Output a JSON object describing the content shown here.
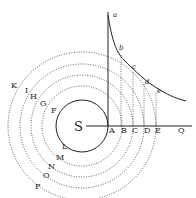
{
  "diagram": {
    "center_label": "S",
    "axis_labels": [
      "A",
      "B",
      "C",
      "D",
      "E",
      "Q"
    ],
    "upper_left_labels": [
      "K",
      "I",
      "H",
      "G",
      "F"
    ],
    "lower_labels": [
      "L",
      "M",
      "N",
      "O",
      "P"
    ],
    "curve_labels": [
      "a",
      "b",
      "c",
      "d",
      "e"
    ],
    "colors": {
      "ink": "#222222",
      "background": "#ffffff"
    }
  }
}
